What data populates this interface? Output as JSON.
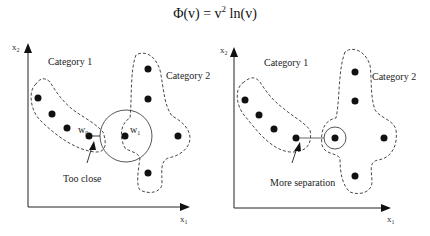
{
  "formula": {
    "lhs": "Φ(v) = v",
    "exp": "2",
    "rhs": " ln(v)"
  },
  "left_diagram": {
    "x_axis_label": "x",
    "x_axis_sub": "1",
    "y_axis_label": "x",
    "y_axis_sub": "2",
    "category1_label": "Category 1",
    "category2_label": "Category 2",
    "w0_label": "w",
    "w0_sub": "0",
    "w1_label": "w",
    "w1_sub": "1",
    "annotation": "Too close"
  },
  "right_diagram": {
    "x_axis_label": "x",
    "x_axis_sub": "1",
    "y_axis_label": "x",
    "y_axis_sub": "2",
    "category1_label": "Category 1",
    "category2_label": "Category 2",
    "annotation": "More separation"
  }
}
